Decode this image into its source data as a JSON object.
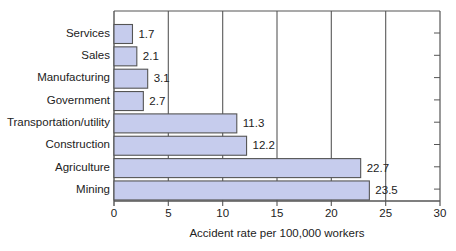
{
  "chart_data": {
    "type": "bar",
    "orientation": "horizontal",
    "title": "",
    "xlabel": "Accident rate per 100,000 workers",
    "ylabel": "",
    "categories": [
      "Services",
      "Sales",
      "Manufacturing",
      "Government",
      "Transportation/utility",
      "Construction",
      "Agriculture",
      "Mining"
    ],
    "values": [
      1.7,
      2.1,
      3.1,
      2.7,
      11.3,
      12.2,
      22.7,
      23.5
    ],
    "value_labels": [
      "1.7",
      "2.1",
      "3.1",
      "2.7",
      "11.3",
      "12.2",
      "22.7",
      "23.5"
    ],
    "xlim": [
      0,
      30
    ],
    "xticks": [
      0,
      5,
      10,
      15,
      20,
      25,
      30
    ],
    "xtick_labels": [
      "0",
      "5",
      "10",
      "15",
      "20",
      "25",
      "30"
    ],
    "grid": "vertical",
    "legend": "none"
  },
  "colors": {
    "bar_fill": "#c6cced",
    "bar_stroke": "#555555",
    "grid": "#666666",
    "frame": "#555555"
  }
}
